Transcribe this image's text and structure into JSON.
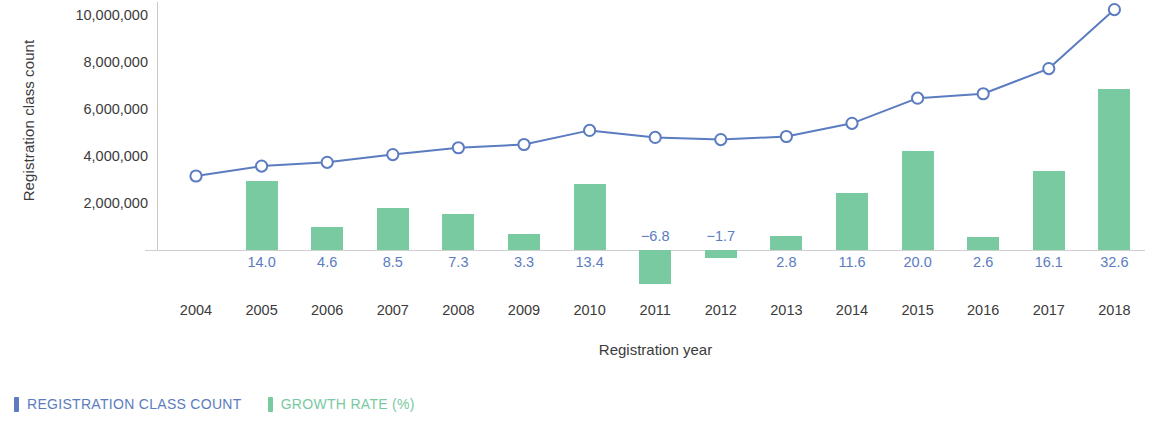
{
  "chart_data": {
    "type": "bar",
    "title": "",
    "xlabel": "Registration year",
    "ylabel": "Registration class count",
    "categories": [
      "2004",
      "2005",
      "2006",
      "2007",
      "2008",
      "2009",
      "2010",
      "2011",
      "2012",
      "2013",
      "2014",
      "2015",
      "2016",
      "2017",
      "2018"
    ],
    "ylim": [
      0,
      10800000
    ],
    "yticks": [
      2000000,
      4000000,
      6000000,
      8000000,
      10000000
    ],
    "ytick_labels": [
      "2,000,000",
      "4,000,000",
      "6,000,000",
      "8,000,000",
      "10,000,000"
    ],
    "grid": false,
    "legend_position": "below-left",
    "series": [
      {
        "name": "REGISTRATION CLASS COUNT",
        "type": "line",
        "color": "#5b7cc0",
        "marker": "open-circle",
        "values": [
          3150000,
          3570000,
          3730000,
          4060000,
          4350000,
          4490000,
          5090000,
          4790000,
          4700000,
          4830000,
          5390000,
          6460000,
          6650000,
          7720000,
          10230000
        ]
      },
      {
        "name": "GROWTH RATE (%)",
        "type": "bar",
        "color": "#79c9a1",
        "values": [
          null,
          14.0,
          4.6,
          8.5,
          7.3,
          3.3,
          13.4,
          -6.8,
          -1.7,
          2.8,
          11.6,
          20.0,
          2.6,
          16.1,
          32.6
        ],
        "value_labels": [
          "",
          "14.0",
          "4.6",
          "8.5",
          "7.3",
          "3.3",
          "13.4",
          "−6.8",
          "−1.7",
          "2.8",
          "11.6",
          "20.0",
          "2.6",
          "16.1",
          "32.6"
        ]
      }
    ],
    "legend": [
      {
        "label": "REGISTRATION CLASS COUNT",
        "color": "#5b7cc0"
      },
      {
        "label": "GROWTH RATE (%)",
        "color": "#79c9a1"
      }
    ]
  },
  "axis": {
    "y_title": "Registration class count",
    "x_title": "Registration year"
  }
}
